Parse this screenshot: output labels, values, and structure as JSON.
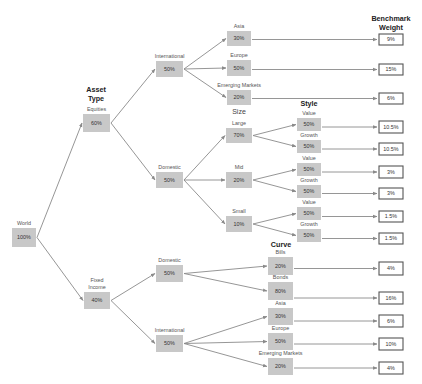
{
  "colors": {
    "node_fill": "#c8c8c8",
    "edge": "#8a8a8a",
    "bench_border": "#555555"
  },
  "headings": [
    {
      "id": "asset-type",
      "lines": [
        "Asset",
        "Type"
      ],
      "x": 96,
      "y": 92,
      "bold": true
    },
    {
      "id": "size",
      "lines": [
        "Size"
      ],
      "x": 239,
      "y": 114,
      "bold": false
    },
    {
      "id": "style",
      "lines": [
        "Style"
      ],
      "x": 309,
      "y": 106,
      "bold": true
    },
    {
      "id": "curve",
      "lines": [
        "Curve"
      ],
      "x": 281,
      "y": 247,
      "bold": true
    },
    {
      "id": "benchmark-weight",
      "lines": [
        "Benchmark",
        "Weight"
      ],
      "x": 391,
      "y": 21,
      "bold": true
    }
  ],
  "nodes": [
    {
      "id": "world",
      "label": [
        "World"
      ],
      "value": "100%",
      "x": 12,
      "y": 228,
      "w": 24,
      "h": 19
    },
    {
      "id": "equities",
      "label": [
        "Equities"
      ],
      "value": "60%",
      "x": 83,
      "y": 114,
      "w": 27,
      "h": 18
    },
    {
      "id": "fixed-income",
      "label": [
        "Fixed",
        "Income"
      ],
      "value": "40%",
      "x": 84,
      "y": 292,
      "w": 26,
      "h": 17
    },
    {
      "id": "eq-international",
      "label": [
        "International"
      ],
      "value": "50%",
      "x": 156,
      "y": 61,
      "w": 27,
      "h": 16
    },
    {
      "id": "eq-domestic",
      "label": [
        "Domestic"
      ],
      "value": "50%",
      "x": 156,
      "y": 172,
      "w": 27,
      "h": 16
    },
    {
      "id": "fi-domestic",
      "label": [
        "Domestic"
      ],
      "value": "50%",
      "x": 156,
      "y": 265,
      "w": 27,
      "h": 17
    },
    {
      "id": "fi-international",
      "label": [
        "International"
      ],
      "value": "50%",
      "x": 156,
      "y": 335,
      "w": 27,
      "h": 17
    },
    {
      "id": "eq-asia",
      "label": [
        "Asia"
      ],
      "value": "30%",
      "x": 227,
      "y": 31,
      "w": 24,
      "h": 15
    },
    {
      "id": "eq-europe",
      "label": [
        "Europe"
      ],
      "value": "50%",
      "x": 227,
      "y": 60,
      "w": 24,
      "h": 16
    },
    {
      "id": "eq-emerging",
      "label": [
        "Emerging Markets"
      ],
      "value": "20%",
      "x": 227,
      "y": 90,
      "w": 24,
      "h": 15
    },
    {
      "id": "large",
      "label": [
        "Large"
      ],
      "value": "70%",
      "x": 226,
      "y": 128,
      "w": 26,
      "h": 15
    },
    {
      "id": "mid",
      "label": [
        "Mid"
      ],
      "value": "20%",
      "x": 226,
      "y": 172,
      "w": 26,
      "h": 16
    },
    {
      "id": "small",
      "label": [
        "Small"
      ],
      "value": "10%",
      "x": 226,
      "y": 216,
      "w": 26,
      "h": 16
    },
    {
      "id": "large-value",
      "label": [
        "Value"
      ],
      "value": "50%",
      "x": 297,
      "y": 118,
      "w": 24,
      "h": 13
    },
    {
      "id": "large-growth",
      "label": [
        "Growth"
      ],
      "value": "50%",
      "x": 297,
      "y": 140,
      "w": 24,
      "h": 13
    },
    {
      "id": "mid-value",
      "label": [
        "Value"
      ],
      "value": "50%",
      "x": 297,
      "y": 163,
      "w": 24,
      "h": 13
    },
    {
      "id": "mid-growth",
      "label": [
        "Growth"
      ],
      "value": "50%",
      "x": 297,
      "y": 185,
      "w": 24,
      "h": 13
    },
    {
      "id": "small-value",
      "label": [
        "Value"
      ],
      "value": "50%",
      "x": 297,
      "y": 207,
      "w": 24,
      "h": 13
    },
    {
      "id": "small-growth",
      "label": [
        "Growth"
      ],
      "value": "50%",
      "x": 297,
      "y": 229,
      "w": 24,
      "h": 13
    },
    {
      "id": "bills",
      "label": [
        "Bills"
      ],
      "value": "20%",
      "x": 268,
      "y": 257,
      "w": 25,
      "h": 18
    },
    {
      "id": "bonds",
      "label": [
        "Bonds"
      ],
      "value": "80%",
      "x": 268,
      "y": 282,
      "w": 25,
      "h": 18
    },
    {
      "id": "fi-asia",
      "label": [
        "Asia"
      ],
      "value": "30%",
      "x": 268,
      "y": 308,
      "w": 25,
      "h": 17
    },
    {
      "id": "fi-europe",
      "label": [
        "Europe"
      ],
      "value": "50%",
      "x": 268,
      "y": 333,
      "w": 25,
      "h": 17
    },
    {
      "id": "fi-emerging",
      "label": [
        "Emerging Markets"
      ],
      "value": "20%",
      "x": 268,
      "y": 358,
      "w": 25,
      "h": 17
    }
  ],
  "benchmarks": [
    {
      "from": "eq-asia",
      "value": "9%",
      "y": 34,
      "h": 11
    },
    {
      "from": "eq-europe",
      "value": "15%",
      "y": 64,
      "h": 11
    },
    {
      "from": "eq-emerging",
      "value": "6%",
      "y": 93,
      "h": 11
    },
    {
      "from": "large-value",
      "value": "10.5%",
      "y": 121,
      "h": 12
    },
    {
      "from": "large-growth",
      "value": "10.5%",
      "y": 143,
      "h": 12
    },
    {
      "from": "mid-value",
      "value": "3%",
      "y": 166,
      "h": 12
    },
    {
      "from": "mid-growth",
      "value": "3%",
      "y": 188,
      "h": 11
    },
    {
      "from": "small-value",
      "value": "1.5%",
      "y": 211,
      "h": 11
    },
    {
      "from": "small-growth",
      "value": "1.5%",
      "y": 233,
      "h": 11
    },
    {
      "from": "bills",
      "value": "4%",
      "y": 262,
      "h": 13
    },
    {
      "from": "bonds",
      "value": "16%",
      "y": 292,
      "h": 12
    },
    {
      "from": "fi-asia",
      "value": "6%",
      "y": 315,
      "h": 12
    },
    {
      "from": "fi-europe",
      "value": "10%",
      "y": 338,
      "h": 12
    },
    {
      "from": "fi-emerging",
      "value": "4%",
      "y": 362,
      "h": 12
    }
  ],
  "bench_x": 379,
  "bench_w": 24,
  "edges": [
    [
      "world",
      "equities"
    ],
    [
      "world",
      "fixed-income"
    ],
    [
      "equities",
      "eq-international"
    ],
    [
      "equities",
      "eq-domestic"
    ],
    [
      "fixed-income",
      "fi-domestic"
    ],
    [
      "fixed-income",
      "fi-international"
    ],
    [
      "eq-international",
      "eq-asia"
    ],
    [
      "eq-international",
      "eq-europe"
    ],
    [
      "eq-international",
      "eq-emerging"
    ],
    [
      "eq-domestic",
      "large"
    ],
    [
      "eq-domestic",
      "mid"
    ],
    [
      "eq-domestic",
      "small"
    ],
    [
      "large",
      "large-value"
    ],
    [
      "large",
      "large-growth"
    ],
    [
      "mid",
      "mid-value"
    ],
    [
      "mid",
      "mid-growth"
    ],
    [
      "small",
      "small-value"
    ],
    [
      "small",
      "small-growth"
    ],
    [
      "fi-domestic",
      "bills"
    ],
    [
      "fi-domestic",
      "bonds"
    ],
    [
      "fi-international",
      "fi-asia"
    ],
    [
      "fi-international",
      "fi-europe"
    ],
    [
      "fi-international",
      "fi-emerging"
    ]
  ]
}
